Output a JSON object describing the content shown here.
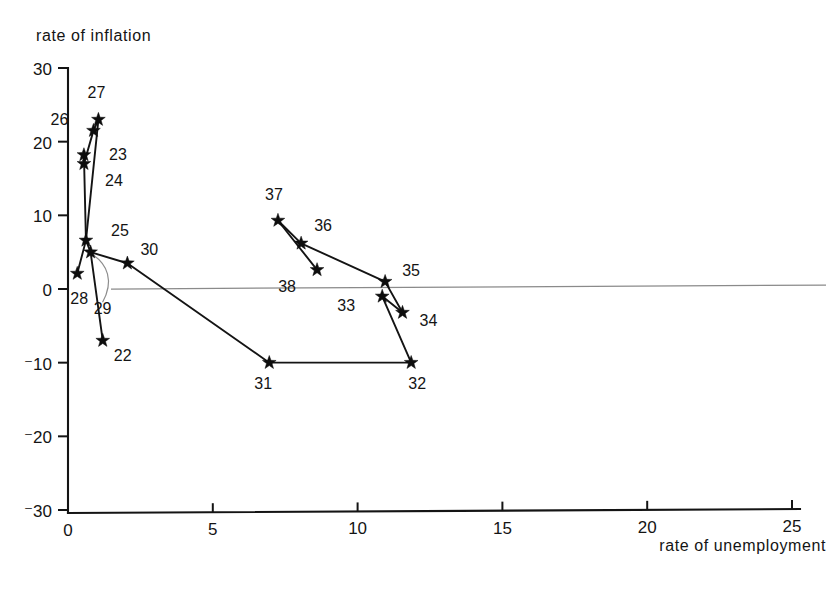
{
  "figure": {
    "ylabel": "rate of inflation",
    "xlabel": "rate of unemployment"
  },
  "axes": {
    "x_ticks": [
      "0",
      "5",
      "10",
      "15",
      "20",
      "25"
    ],
    "y_ticks": [
      "30",
      "20",
      "10",
      "0",
      "⁻10",
      "⁻20",
      "⁻30"
    ]
  },
  "chart_data": {
    "type": "scatter",
    "title": "",
    "subtitle": "",
    "xlabel": "rate of unemployment",
    "ylabel": "rate of inflation",
    "xlim": [
      0,
      25.6
    ],
    "ylim": [
      -30,
      30
    ],
    "x_ticks": [
      0,
      5,
      10,
      15,
      20,
      25
    ],
    "y_ticks": [
      30,
      20,
      10,
      0,
      -10,
      -20,
      -30
    ],
    "grid": false,
    "legend": null,
    "zero_line": true,
    "marker": "star",
    "connected": true,
    "annotations": [
      "horizontal reference line drawn at inflation = 0"
    ],
    "points": [
      {
        "label": "22",
        "x": 1.2,
        "y": -7.0,
        "label_dx": 20,
        "label_dy": 20
      },
      {
        "label": "23",
        "x": 0.55,
        "y": 18.2,
        "label_dx": 34,
        "label_dy": 5
      },
      {
        "label": "24",
        "x": 0.55,
        "y": 17.0,
        "label_dx": 30,
        "label_dy": 22
      },
      {
        "label": "25",
        "x": 0.62,
        "y": 6.6,
        "label_dx": 34,
        "label_dy": -4
      },
      {
        "label": "26",
        "x": 0.88,
        "y": 21.5,
        "label_dx": -34,
        "label_dy": -6
      },
      {
        "label": "27",
        "x": 1.05,
        "y": 23.0,
        "label_dx": -2,
        "label_dy": -22
      },
      {
        "label": "28",
        "x": 0.32,
        "y": 2.1,
        "label_dx": 2,
        "label_dy": 30
      },
      {
        "label": "29",
        "x": 0.78,
        "y": 5.0,
        "label_dx": 12,
        "label_dy": 62
      },
      {
        "label": "30",
        "x": 2.05,
        "y": 3.5,
        "label_dx": 22,
        "label_dy": -8
      },
      {
        "label": "31",
        "x": 6.95,
        "y": -10.0,
        "label_dx": -6,
        "label_dy": 26
      },
      {
        "label": "32",
        "x": 11.85,
        "y": -10.0,
        "label_dx": 6,
        "label_dy": 26
      },
      {
        "label": "33",
        "x": 10.85,
        "y": -1.0,
        "label_dx": -36,
        "label_dy": 15
      },
      {
        "label": "34",
        "x": 11.55,
        "y": -3.2,
        "label_dx": 26,
        "label_dy": 13
      },
      {
        "label": "35",
        "x": 10.95,
        "y": 1.0,
        "label_dx": 26,
        "label_dy": -6
      },
      {
        "label": "36",
        "x": 8.05,
        "y": 6.2,
        "label_dx": 22,
        "label_dy": -12
      },
      {
        "label": "37",
        "x": 7.25,
        "y": 9.3,
        "label_dx": -4,
        "label_dy": -20
      },
      {
        "label": "38",
        "x": 8.6,
        "y": 2.6,
        "label_dx": -30,
        "label_dy": 22
      }
    ],
    "path_order": [
      "23",
      "24",
      "25",
      "26",
      "27",
      "28",
      "29",
      "22"
    ],
    "segments": [
      [
        "23",
        "24"
      ],
      [
        "24",
        "26"
      ],
      [
        "26",
        "27"
      ],
      [
        "27",
        "25"
      ],
      [
        "25",
        "23"
      ],
      [
        "25",
        "28"
      ],
      [
        "25",
        "29"
      ],
      [
        "29",
        "22"
      ],
      [
        "29",
        "30"
      ],
      [
        "30",
        "31"
      ],
      [
        "31",
        "32"
      ],
      [
        "32",
        "33"
      ],
      [
        "33",
        "34"
      ],
      [
        "34",
        "35"
      ],
      [
        "35",
        "36"
      ],
      [
        "36",
        "37"
      ],
      [
        "37",
        "38"
      ]
    ],
    "leader_lines": [
      {
        "from_label": "29",
        "to_point": "29"
      }
    ]
  }
}
